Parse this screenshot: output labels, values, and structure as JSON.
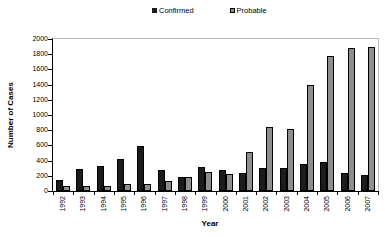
{
  "chart_data": {
    "type": "bar",
    "title": "",
    "xlabel": "Year",
    "ylabel": "Number of Cases",
    "ylim": [
      0,
      2000
    ],
    "yticks": [
      0,
      200,
      400,
      600,
      800,
      1000,
      1200,
      1400,
      1600,
      1800,
      2000
    ],
    "categories": [
      "1992",
      "1993",
      "1994",
      "1995",
      "1996",
      "1997",
      "1998",
      "1999",
      "2000",
      "2001",
      "2002",
      "2003",
      "2004",
      "2005",
      "2006",
      "2007"
    ],
    "series": [
      {
        "name": "Confirmed",
        "color": "#1c1c1c",
        "values": [
          140,
          285,
          335,
          420,
          590,
          270,
          190,
          315,
          280,
          240,
          300,
          300,
          360,
          375,
          235,
          210
        ]
      },
      {
        "name": "Probable",
        "color": "#8e8e8e",
        "values": [
          65,
          60,
          60,
          90,
          90,
          125,
          190,
          245,
          220,
          510,
          840,
          820,
          1390,
          1770,
          1880,
          1890
        ]
      }
    ],
    "legend_position": "top",
    "grid": false,
    "axis_color": "#000000",
    "frame_color": "#b8b8b8"
  }
}
